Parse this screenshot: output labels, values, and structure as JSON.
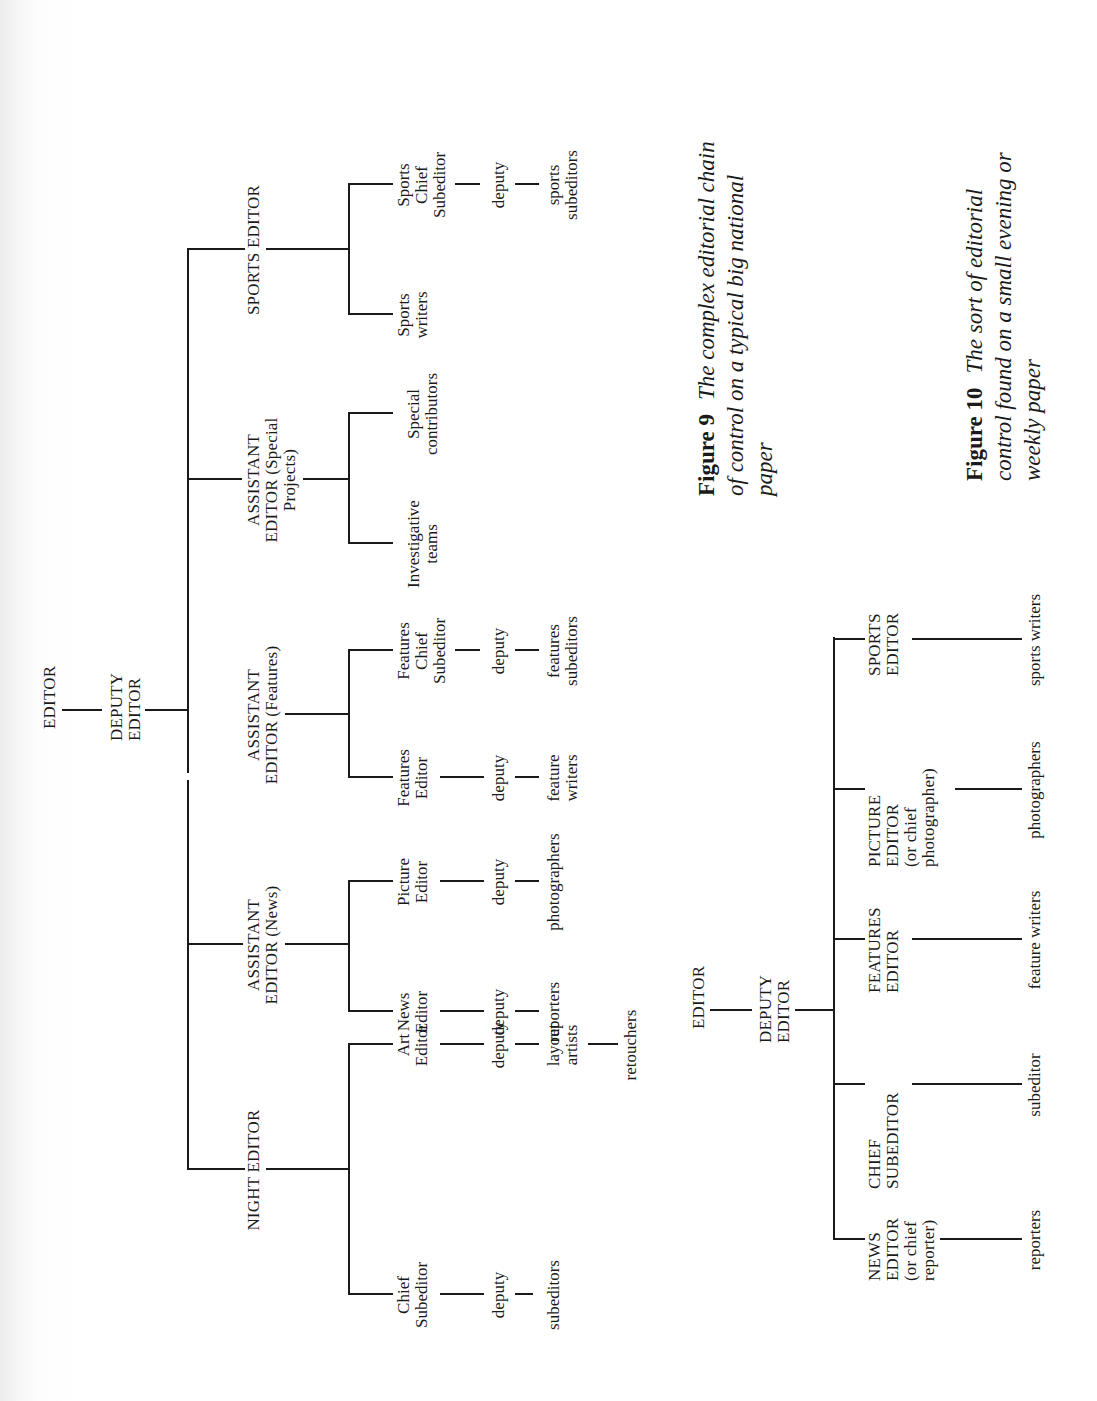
{
  "figure9": {
    "caption": {
      "number": "Figure 9",
      "lines": [
        "The complex editorial chain",
        "of control on a typical big national",
        "paper"
      ]
    },
    "root": "EDITOR",
    "deputy": [
      "DEPUTY",
      "EDITOR"
    ],
    "branches": [
      {
        "title": [
          "NIGHT EDITOR"
        ],
        "children": [
          {
            "chain": [
              [
                "Chief",
                "Subeditor"
              ],
              [
                "deputy"
              ],
              [
                "subeditors"
              ]
            ]
          },
          {
            "chain": [
              [
                "Art",
                "Editor"
              ],
              [
                "deputy"
              ],
              [
                "layout",
                "artists"
              ],
              [
                "retouchers"
              ]
            ]
          }
        ]
      },
      {
        "title": [
          "ASSISTANT",
          "EDITOR (News)"
        ],
        "children": [
          {
            "chain": [
              [
                "News",
                "Editor"
              ],
              [
                "deputy"
              ],
              [
                "reporters"
              ]
            ]
          },
          {
            "chain": [
              [
                "Picture",
                "Editor"
              ],
              [
                "deputy"
              ],
              [
                "photographers"
              ]
            ]
          }
        ]
      },
      {
        "title": [
          "ASSISTANT",
          "EDITOR (Features)"
        ],
        "children": [
          {
            "chain": [
              [
                "Features",
                "Editor"
              ],
              [
                "deputy"
              ],
              [
                "feature",
                "writers"
              ]
            ]
          },
          {
            "chain": [
              [
                "Features",
                "Chief",
                "Subeditor"
              ],
              [
                "deputy"
              ],
              [
                "features",
                "subeditors"
              ]
            ]
          }
        ]
      },
      {
        "title": [
          "ASSISTANT",
          "EDITOR (Special",
          "Projects)"
        ],
        "children": [
          {
            "chain": [
              [
                "Investigative",
                "teams"
              ]
            ]
          },
          {
            "chain": [
              [
                "Special",
                "contributors"
              ]
            ]
          }
        ]
      },
      {
        "title": [
          "SPORTS EDITOR"
        ],
        "children": [
          {
            "chain": [
              [
                "Sports",
                "writers"
              ]
            ]
          },
          {
            "chain": [
              [
                "Sports",
                "Chief",
                "Subeditor"
              ],
              [
                "deputy"
              ],
              [
                "sports",
                "subeditors"
              ]
            ]
          }
        ]
      }
    ]
  },
  "figure10": {
    "caption": {
      "number": "Figure 10",
      "lines": [
        "The sort of editorial",
        "control found on a small evening or",
        "weekly paper"
      ]
    },
    "root": "EDITOR",
    "deputy": [
      "DEPUTY",
      "EDITOR"
    ],
    "branches": [
      {
        "title": [
          "NEWS",
          "EDITOR",
          "(or chief",
          "reporter)"
        ],
        "staff": "reporters"
      },
      {
        "title": [
          "CHIEF",
          "SUBEDITOR"
        ],
        "staff": "subeditor"
      },
      {
        "title": [
          "FEATURES",
          "EDITOR"
        ],
        "staff": "feature writers"
      },
      {
        "title": [
          "PICTURE",
          "EDITOR",
          "(or chief",
          "photographer)"
        ],
        "staff": "photographers"
      },
      {
        "title": [
          "SPORTS",
          "EDITOR"
        ],
        "staff": "sports writers"
      }
    ]
  }
}
